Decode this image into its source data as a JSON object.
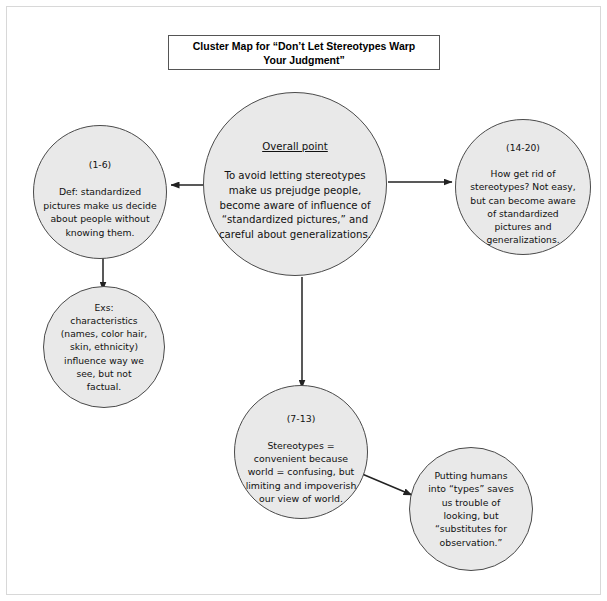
{
  "page": {
    "title_line1": "Cluster Map for “Don’t Let Stereotypes Warp",
    "title_line2": "Your Judgment”",
    "title_full": "Cluster Map for “Don’t Let Stereotypes Warp\nYour Judgment”",
    "background_color": "#ffffff",
    "border_color": "#d8d8d8"
  },
  "style": {
    "node_fill": "#e9e9e9",
    "node_stroke": "#4a4a4a",
    "connector_color": "#222222",
    "text_color": "#111111"
  },
  "nodes": {
    "central": {
      "name": "overall-point",
      "heading": "Overall point",
      "body": "To avoid letting stereotypes\nmake us prejudge people,\nbecome aware of influence of\n“standardized pictures,” and\ncareful about generalizations.",
      "paragraphs": ""
    },
    "definition": {
      "name": "definition",
      "paragraphs": "(1-6)",
      "body": "Def: standardized\npictures make us decide\nabout people without\nknowing them."
    },
    "how_to": {
      "name": "how-get-rid-of-stereotypes",
      "paragraphs": "(14-20)",
      "body": "How get rid of\nstereotypes? Not easy,\nbut can become aware\nof standardized\npictures and\ngeneralizations."
    },
    "examples": {
      "name": "examples",
      "paragraphs": "",
      "body": "Exs:\ncharacteristics\n(names, color hair,\nskin, ethnicity)\ninfluence way we\nsee, but not\nfactual."
    },
    "stereotypes": {
      "name": "stereotypes-convenient",
      "paragraphs": "(7-13)",
      "body": "Stereotypes =\nconvenient because\nworld = confusing, but\nlimiting and impoverish\nour view of world."
    },
    "types": {
      "name": "putting-humans-into-types",
      "paragraphs": "",
      "body": "Putting humans\ninto “types” saves\nus trouble of\nlooking, but\n“substitutes for\nobservation.”"
    }
  },
  "connectors": [
    {
      "name": "central-to-definition",
      "from": "central",
      "to": "definition",
      "direction": "left"
    },
    {
      "name": "central-to-how-to",
      "from": "central",
      "to": "how_to",
      "direction": "right"
    },
    {
      "name": "definition-to-examples",
      "from": "definition",
      "to": "examples",
      "direction": "down"
    },
    {
      "name": "central-to-stereotypes",
      "from": "central",
      "to": "stereotypes",
      "direction": "down"
    },
    {
      "name": "stereotypes-to-types",
      "from": "stereotypes",
      "to": "types",
      "direction": "down-right"
    }
  ]
}
